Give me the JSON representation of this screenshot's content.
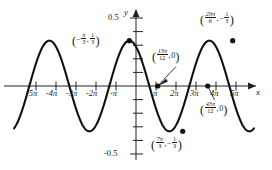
{
  "figure": {
    "kind": "cosine-graph",
    "axis_labels": {
      "x": "x",
      "y": "y"
    },
    "curve_color": "#111111",
    "axis_color": "#222222"
  },
  "chart_data": {
    "type": "line",
    "title": "",
    "xlabel": "x",
    "ylabel": "y",
    "function": "y = (1/3)cos((x + pi/3)/2)",
    "amplitude": 0.3333,
    "period_over_pi": 4,
    "phase_shift_over_pi": -0.3333,
    "xlim_over_pi": [
      -6.1,
      5.9
    ],
    "ylim": [
      -0.62,
      0.62
    ],
    "grid": false,
    "legend": "none",
    "x_tick_labels": [
      "-5π",
      "-4π",
      "-3π",
      "-2π",
      "-π",
      "π",
      "2π",
      "3π",
      "4π",
      "5π"
    ],
    "x_tick_values_over_pi": [
      -5,
      -4,
      -3,
      -2,
      -1,
      1,
      2,
      3,
      4,
      5
    ],
    "y_tick_labels": [
      "0.5",
      "-0.5"
    ],
    "y_tick_values": [
      0.5,
      -0.5
    ],
    "y_minor_ticks": [
      0.4,
      0.3,
      0.2,
      0.1,
      -0.1,
      -0.2,
      -0.3,
      -0.4
    ],
    "marked_points": [
      {
        "x_over_pi": -0.3333,
        "y": 0.3333,
        "kind": "maximum"
      },
      {
        "x_over_pi": 1.0833,
        "y": 0,
        "kind": "zero"
      },
      {
        "x_over_pi": 2.3333,
        "y": -0.3333,
        "kind": "minimum"
      },
      {
        "x_over_pi": 3.5833,
        "y": 0,
        "kind": "zero"
      },
      {
        "x_over_pi": 4.8333,
        "y": 0.3333,
        "kind": "maximum"
      }
    ]
  },
  "annotations": {
    "max_left": {
      "x_num": "π",
      "x_den": "3",
      "x_neg": true,
      "y_num": "1",
      "y_den": "3",
      "y_neg": false
    },
    "zero_one": {
      "x_num": "13π",
      "x_den": "12",
      "y_text": "0"
    },
    "min_mid": {
      "x_num": "7π",
      "x_den": "3",
      "y_num": "1",
      "y_den": "3",
      "y_neg": true
    },
    "zero_two": {
      "x_num": "43π",
      "x_den": "12",
      "y_text": "0"
    },
    "max_right": {
      "x_num": "29π",
      "x_den": "6",
      "y_num": "1",
      "y_den": "3",
      "y_neg": true
    }
  },
  "ticks": {
    "x": [
      {
        "label": "-5π",
        "px": 36
      },
      {
        "label": "-4π",
        "px": 56
      },
      {
        "label": "-3π",
        "px": 76
      },
      {
        "label": "-2π",
        "px": 96
      },
      {
        "label": "-π",
        "px": 116
      },
      {
        "label": "π",
        "px": 156
      },
      {
        "label": "2π",
        "px": 176
      },
      {
        "label": "3π",
        "px": 196
      },
      {
        "label": "4π",
        "px": 216
      },
      {
        "label": "5π",
        "px": 236
      }
    ],
    "y_major": [
      {
        "label": "0.5",
        "py": 18
      },
      {
        "label": "-0.5",
        "py": 154
      }
    ]
  }
}
